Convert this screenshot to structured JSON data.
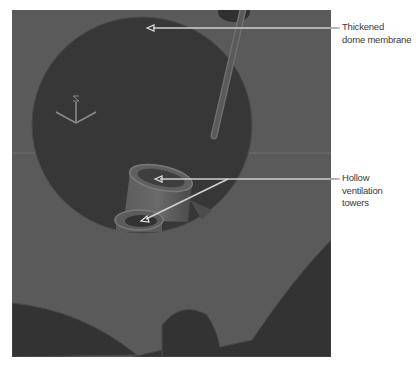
{
  "figure": {
    "type": "3D CAD render with callout labels",
    "colors": {
      "background": "#5a5a5a",
      "dome_interior": "#383838",
      "lower_cutouts": "#333333",
      "leader_line": "#cfcfcf",
      "label_text": "#3a3a3a"
    }
  },
  "callouts": [
    {
      "id": "dome",
      "lines": [
        "Thickened",
        "dome membrane"
      ]
    },
    {
      "id": "towers",
      "lines": [
        "Hollow",
        "ventilation",
        "towers"
      ]
    }
  ],
  "gizmo": {
    "axes": [
      "x",
      "y",
      "z"
    ]
  }
}
